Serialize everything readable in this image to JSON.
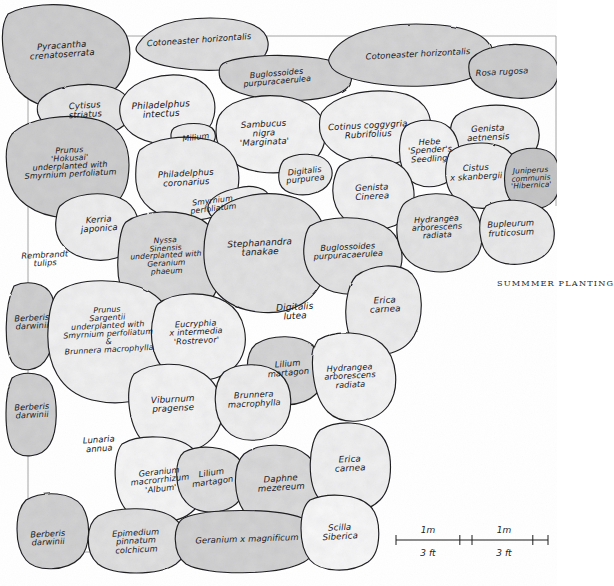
{
  "figure": {
    "caption": "SUMMMER PLANTING",
    "caption_x": 497,
    "caption_y": 278
  },
  "scale_bar": {
    "x": 396,
    "y": 540,
    "width": 152,
    "labels_above": [
      "1m",
      "1m"
    ],
    "labels_below": [
      "3 ft",
      "3 ft"
    ]
  },
  "beds": [
    {
      "name": "pyracantha-crenatoserrata",
      "text": "Pyracantha\ncrenatoserrata",
      "cx": 62,
      "cy": 50,
      "fs": 8.6,
      "rot": -4,
      "tone": 0.46,
      "path": "M 8,14 C 26,4 58,2 82,8 C 106,14 124,24 128,40 C 133,58 128,78 112,92 C 96,106 66,112 44,106 C 24,100 10,86 6,66 C 2,48 0,26 8,14 Z"
    },
    {
      "name": "cotoneaster-horizontalis-left",
      "text": "Cotoneaster horizontalis",
      "cx": 199,
      "cy": 40,
      "fs": 8.4,
      "rot": -4,
      "tone": 0.3,
      "path": "M 138,44 C 150,26 176,18 210,18 C 244,18 266,26 268,42 C 270,58 254,68 222,70 C 190,72 156,66 144,58 C 136,52 134,50 138,44 Z"
    },
    {
      "name": "buglossoides-purpurocaerulea-top",
      "text": "Buglossoides\npurpuracaerulea",
      "cx": 277,
      "cy": 78,
      "fs": 8.0,
      "rot": -5,
      "tone": 0.42,
      "path": "M 226,62 C 250,54 286,54 318,58 C 344,62 356,72 350,84 C 344,96 314,102 280,100 C 248,98 224,90 220,78 C 218,70 220,64 226,62 Z"
    },
    {
      "name": "cotoneaster-horizontalis-right",
      "text": "Cotoneaster horizontalis",
      "cx": 418,
      "cy": 54,
      "fs": 8.4,
      "rot": -3,
      "tone": 0.4,
      "path": "M 330,56 C 340,36 372,24 416,24 C 462,24 490,34 492,52 C 494,72 470,84 424,86 C 378,88 340,78 332,68 C 328,62 328,60 330,56 Z"
    },
    {
      "name": "rosa-rugosa",
      "text": "Rosa rugosa",
      "cx": 502,
      "cy": 72,
      "fs": 8.4,
      "rot": -3,
      "tone": 0.46,
      "path": "M 472,58 C 484,46 510,42 532,46 C 552,50 560,62 558,76 C 556,92 538,100 514,98 C 492,96 474,88 470,76 C 468,68 468,62 472,58 Z"
    },
    {
      "name": "cytisus-striatus",
      "text": "Cytisus\nstriatus",
      "cx": 85,
      "cy": 110,
      "fs": 8.6,
      "rot": -4,
      "tone": 0.22,
      "path": "M 42,98 C 54,86 84,82 106,86 C 126,90 134,102 130,116 C 126,130 104,138 80,136 C 58,134 42,126 38,114 C 36,106 38,102 42,98 Z"
    },
    {
      "name": "philadelphus-intectus",
      "text": "Philadelphus\nintectus",
      "cx": 161,
      "cy": 110,
      "fs": 9.0,
      "rot": -3,
      "tone": 0.1,
      "path": "M 124,96 C 134,80 162,72 186,76 C 208,80 218,96 214,116 C 210,136 188,146 162,144 C 138,142 122,130 120,114 C 119,106 121,100 124,96 Z"
    },
    {
      "name": "sambucus-nigra-marginata",
      "text": "Sambucus\nnigra\n'Marginata'",
      "cx": 264,
      "cy": 133,
      "fs": 8.6,
      "rot": -3,
      "tone": 0.1,
      "path": "M 222,112 C 234,98 264,92 292,98 C 318,104 330,122 324,144 C 318,166 290,176 260,172 C 232,168 216,152 216,132 C 216,122 218,116 222,112 Z"
    },
    {
      "name": "cotinus-coggygria-rubrifolius",
      "text": "Cotinus coggygria\nRubrifolius",
      "cx": 368,
      "cy": 130,
      "fs": 8.6,
      "rot": -3,
      "tone": 0.1,
      "path": "M 322,112 C 334,96 364,88 396,92 C 422,96 434,112 430,134 C 426,156 402,166 372,164 C 344,162 324,150 320,132 C 319,124 320,116 322,112 Z"
    },
    {
      "name": "genista-aetnensis",
      "text": "Genista\naetnensis",
      "cx": 488,
      "cy": 133,
      "fs": 8.6,
      "rot": -3,
      "tone": 0.14,
      "path": "M 456,116 C 468,106 496,102 518,108 C 536,114 542,128 538,144 C 534,160 512,168 488,166 C 464,164 450,152 450,136 C 450,126 452,120 456,116 Z"
    },
    {
      "name": "hebe-spenders-seedling",
      "text": "Hebe\n'Spender's\nSeedling'",
      "cx": 430,
      "cy": 150,
      "fs": 8.2,
      "rot": -3,
      "tone": 0.1,
      "path": "M 406,126 C 418,118 440,118 450,128 C 460,138 462,158 456,172 C 450,186 430,190 416,184 C 402,178 398,160 400,142 C 401,134 403,129 406,126 Z"
    },
    {
      "name": "cistus-x-skanbergii",
      "text": "Cistus\nx skanbergii",
      "cx": 476,
      "cy": 172,
      "fs": 8.4,
      "rot": -3,
      "tone": 0.14,
      "path": "M 450,152 C 462,142 488,140 504,148 C 518,156 522,174 516,190 C 510,206 486,212 468,206 C 450,200 444,184 446,166 C 447,159 448,155 450,152 Z"
    },
    {
      "name": "juniperus-communis-hibernica",
      "text": "Juniperus\ncommunis\n'Hibernica'",
      "cx": 531,
      "cy": 178,
      "fs": 7.4,
      "rot": -3,
      "tone": 0.54,
      "path": "M 512,154 C 524,146 546,146 554,156 C 562,168 562,190 554,200 C 544,212 522,212 512,202 C 502,192 502,166 512,154 Z"
    },
    {
      "name": "prunus-hokusai",
      "text": "Prunus\n'Hokusai'\nunderplanted with\nSmyrnium perfoliatum",
      "cx": 70,
      "cy": 163,
      "fs": 8.0,
      "rot": -3,
      "tone": 0.46,
      "path": "M 12,134 C 28,118 68,112 98,120 C 124,128 132,150 128,178 C 124,206 100,220 66,218 C 34,216 12,200 8,176 C 5,158 6,142 12,134 Z"
    },
    {
      "name": "milium",
      "text": "Milium",
      "cx": 196,
      "cy": 138,
      "fs": 8.0,
      "rot": -7,
      "tone": 0.14,
      "path": "M 174,128 C 184,122 204,122 212,128 C 218,134 216,144 206,148 C 194,152 176,150 172,142 C 170,136 171,130 174,128 Z"
    },
    {
      "name": "philadelphus-coronarius",
      "text": "Philadelphus\ncoronarius",
      "cx": 186,
      "cy": 178,
      "fs": 8.6,
      "rot": -3,
      "tone": 0.14,
      "path": "M 140,150 C 154,138 184,134 210,140 C 232,146 242,164 238,188 C 234,212 212,222 184,220 C 156,218 138,204 136,182 C 135,168 137,154 140,150 Z"
    },
    {
      "name": "smyrnium-perfoliatum-mid",
      "text": "Smyrnium\nperfoliatum",
      "cx": 213,
      "cy": 205,
      "fs": 7.8,
      "rot": -7,
      "tone": 0.12,
      "path": "M 238,188 C 252,184 268,188 270,198 C 272,210 258,220 238,222 C 220,224 208,218 208,208 C 208,198 222,191 238,188 Z"
    },
    {
      "name": "digitalis-purpurea",
      "text": "Digitalis\npurpurea",
      "cx": 305,
      "cy": 175,
      "fs": 8.2,
      "rot": -6,
      "tone": 0.16,
      "path": "M 284,160 C 296,152 320,152 328,162 C 336,172 332,186 318,192 C 302,198 284,194 280,184 C 277,176 280,164 284,160 Z"
    },
    {
      "name": "genista-cinerea",
      "text": "Genista\nCinerea",
      "cx": 372,
      "cy": 192,
      "fs": 8.6,
      "rot": -3,
      "tone": 0.12,
      "path": "M 340,166 C 352,156 380,154 398,164 C 414,174 418,196 410,212 C 402,228 376,234 356,226 C 336,218 330,198 334,180 C 336,172 338,168 340,166 Z"
    },
    {
      "name": "kerria-japonica",
      "text": "Kerria\njaponica",
      "cx": 99,
      "cy": 224,
      "fs": 8.6,
      "rot": -4,
      "tone": 0.14,
      "path": "M 60,206 C 72,194 100,190 120,198 C 138,206 142,224 136,240 C 130,258 106,264 84,258 C 62,252 54,236 56,220 C 57,212 58,208 60,206 Z"
    },
    {
      "name": "nyssa-sinensis",
      "text": "Nyssa\nSinensis\nunderplanted with\nGeranium\nphaeum",
      "cx": 166,
      "cy": 256,
      "fs": 7.6,
      "rot": -3,
      "tone": 0.34,
      "path": "M 126,222 C 142,210 180,208 202,220 C 222,232 226,260 218,286 C 210,312 182,322 154,316 C 126,310 116,288 118,258 C 119,240 122,226 126,222 Z"
    },
    {
      "name": "stephanandra-tanakae",
      "text": "Stephanandra\ntanakae",
      "cx": 260,
      "cy": 248,
      "fs": 9.0,
      "rot": -3,
      "tone": 0.26,
      "path": "M 212,216 C 228,196 266,188 296,198 C 322,208 332,236 326,268 C 320,300 292,316 258,312 C 224,308 206,288 204,258 C 203,236 208,222 212,216 Z"
    },
    {
      "name": "buglossoides-purpurocaerulea-mid",
      "text": "Buglossoides\npurpuracaerulea",
      "cx": 348,
      "cy": 251,
      "fs": 8.2,
      "rot": -3,
      "tone": 0.26,
      "path": "M 310,226 C 326,216 362,214 384,226 C 402,236 406,258 398,274 C 388,292 358,298 334,292 C 312,286 302,266 304,246 C 305,236 307,229 310,226 Z"
    },
    {
      "name": "hydrangea-arborescens-radiata-top",
      "text": "Hydrangea\narborescens\nradiata",
      "cx": 437,
      "cy": 228,
      "fs": 8.0,
      "rot": -3,
      "tone": 0.24,
      "path": "M 406,202 C 420,192 450,190 466,202 C 482,214 486,238 478,254 C 468,272 440,276 420,268 C 400,260 394,238 398,218 C 400,209 403,204 406,202 Z"
    },
    {
      "name": "bupleurum-fruticosum",
      "text": "Bupleurum\nfruticosum",
      "cx": 511,
      "cy": 228,
      "fs": 8.4,
      "rot": -3,
      "tone": 0.18,
      "path": "M 486,206 C 500,198 528,198 542,208 C 556,218 558,240 548,252 C 536,266 506,268 492,258 C 478,248 476,220 486,206 Z"
    },
    {
      "name": "rembrandt-tulips",
      "text": "Rembrandt\ntulips",
      "cx": 45,
      "cy": 259,
      "fs": 8.2,
      "rot": -3,
      "tone": 0.05,
      "path": ""
    },
    {
      "name": "berberis-darwinii-1",
      "text": "Berberis\ndarwinii",
      "cx": 32,
      "cy": 322,
      "fs": 8.2,
      "rot": -3,
      "tone": 0.44,
      "path": "M 14,286 C 26,280 46,282 52,296 C 58,312 56,342 48,356 C 40,372 20,374 12,362 C 4,348 4,306 14,286 Z"
    },
    {
      "name": "prunus-sargentii",
      "text": "Prunus\nSargentii\nunderplanted with\nSmyrnium perfoliatum\n&\nBrunnera macrophylla",
      "cx": 108,
      "cy": 330,
      "fs": 7.8,
      "rot": -3,
      "tone": 0.12,
      "path": "M 58,292 C 76,278 122,276 150,292 C 176,308 184,342 174,370 C 164,398 126,408 92,400 C 60,392 46,364 48,330 C 49,310 53,297 58,292 Z"
    },
    {
      "name": "eucryphia-x-intermedia-rostrevor",
      "text": "Eucryphia\nx intermedia\n'Rostrevor'",
      "cx": 196,
      "cy": 332,
      "fs": 8.2,
      "rot": -3,
      "tone": 0.1,
      "path": "M 158,304 C 172,292 206,290 226,302 C 246,314 250,342 240,360 C 228,380 196,386 174,376 C 152,366 148,336 154,314 C 155,309 156,306 158,304 Z"
    },
    {
      "name": "digitalis-lutea",
      "text": "Digitalis\nlutea",
      "cx": 295,
      "cy": 312,
      "fs": 9.0,
      "rot": -3,
      "tone": 0.08,
      "path": ""
    },
    {
      "name": "erica-carnea-top",
      "text": "Erica\ncarnea",
      "cx": 385,
      "cy": 305,
      "fs": 8.8,
      "rot": -3,
      "tone": 0.16,
      "path": "M 356,276 C 372,264 400,262 412,274 C 424,288 424,318 414,336 C 402,356 372,360 358,348 C 342,334 342,292 356,276 Z"
    },
    {
      "name": "lilium-martagon-top",
      "text": "Lilium\nmartagon",
      "cx": 288,
      "cy": 368,
      "fs": 8.4,
      "rot": -5,
      "tone": 0.38,
      "path": "M 256,344 C 272,334 300,334 314,346 C 328,358 328,382 316,394 C 302,408 272,408 258,396 C 244,384 244,354 256,344 Z"
    },
    {
      "name": "hydrangea-arborescens-radiata-mid",
      "text": "Hydrangea\narborescens\nradiata",
      "cx": 350,
      "cy": 376,
      "fs": 8.2,
      "rot": -3,
      "tone": 0.1,
      "path": "M 318,340 C 334,330 366,330 382,344 C 398,358 400,390 388,406 C 374,424 342,426 328,412 C 312,396 308,354 318,340 Z"
    },
    {
      "name": "viburnum-pragense",
      "text": "Viburnum\npragense",
      "cx": 173,
      "cy": 404,
      "fs": 8.8,
      "rot": -3,
      "tone": 0.1,
      "path": "M 134,374 C 150,362 184,360 204,374 C 224,388 228,418 214,436 C 198,456 164,458 146,444 C 128,430 124,388 134,374 Z"
    },
    {
      "name": "brunnera-macrophylla",
      "text": "Brunnera\nmacrophylla",
      "cx": 254,
      "cy": 399,
      "fs": 8.4,
      "rot": -3,
      "tone": 0.14,
      "path": "M 224,372 C 238,362 266,362 280,374 C 294,386 294,414 282,428 C 268,444 238,444 226,430 C 212,416 212,384 224,372 Z"
    },
    {
      "name": "lunaria-annua",
      "text": "Lunaria\nannua",
      "cx": 99,
      "cy": 444,
      "fs": 8.4,
      "rot": -4,
      "tone": 0.08,
      "path": ""
    },
    {
      "name": "berberis-darwinii-2",
      "text": "Berberis\ndarwinii",
      "cx": 32,
      "cy": 411,
      "fs": 8.2,
      "rot": -3,
      "tone": 0.44,
      "path": "M 12,378 C 24,370 46,372 52,386 C 58,402 58,430 50,444 C 42,458 20,460 12,448 C 4,434 4,394 12,378 Z"
    },
    {
      "name": "geranium-macrorrhizum-album",
      "text": "Geranium\nmacrorrhizum\n'Album'",
      "cx": 160,
      "cy": 480,
      "fs": 8.2,
      "rot": -6,
      "tone": 0.08,
      "path": "M 122,444 C 138,434 176,434 192,448 C 208,462 208,496 194,510 C 178,526 142,526 128,512 C 112,496 112,456 122,444 Z"
    },
    {
      "name": "lilium-martagon-bottom",
      "text": "Lilium\nmartagon",
      "cx": 212,
      "cy": 477,
      "fs": 8.4,
      "rot": -8,
      "tone": 0.3,
      "path": "M 184,452 C 200,444 226,446 238,458 C 250,470 248,494 236,504 C 222,516 196,514 186,502 C 174,490 174,460 184,452 Z"
    },
    {
      "name": "daphne-mezereum",
      "text": "Daphne\nmezereum",
      "cx": 281,
      "cy": 483,
      "fs": 8.6,
      "rot": -4,
      "tone": 0.34,
      "path": "M 244,454 C 260,442 292,442 308,456 C 324,470 326,500 312,514 C 296,530 262,530 248,516 C 232,500 232,466 244,454 Z"
    },
    {
      "name": "erica-carnea-bottom",
      "text": "Erica\ncarnea",
      "cx": 350,
      "cy": 464,
      "fs": 8.8,
      "rot": -3,
      "tone": 0.12,
      "path": "M 320,430 C 336,420 366,420 380,434 C 394,448 394,486 380,500 C 364,516 332,516 320,500 C 306,484 308,442 320,430 Z"
    },
    {
      "name": "berberis-darwinii-3",
      "text": "Berberis\ndarwinii",
      "cx": 48,
      "cy": 538,
      "fs": 8.2,
      "rot": -3,
      "tone": 0.42,
      "path": "M 26,500 C 44,490 72,492 82,506 C 92,522 90,548 80,558 C 66,572 36,572 26,560 C 14,546 14,512 26,500 Z"
    },
    {
      "name": "epimedium-pinnatum-colchicum",
      "text": "Epimedium\npinnatum\ncolchicum",
      "cx": 136,
      "cy": 541,
      "fs": 8.2,
      "rot": -3,
      "tone": 0.28,
      "path": "M 98,516 C 116,506 158,506 174,518 C 190,530 190,554 176,564 C 158,576 114,576 98,564 C 84,552 86,524 98,516 Z"
    },
    {
      "name": "geranium-x-magnificum",
      "text": "Geranium x magnificum",
      "cx": 247,
      "cy": 539,
      "fs": 8.4,
      "rot": -2,
      "tone": 0.42,
      "path": "M 184,518 C 206,508 276,508 302,518 C 322,526 322,552 304,562 C 278,576 206,576 186,564 C 172,554 172,524 184,518 Z"
    },
    {
      "name": "scilla-siberica",
      "text": "Scilla\nSiberica",
      "cx": 340,
      "cy": 532,
      "fs": 8.6,
      "rot": -3,
      "tone": 0.06,
      "path": "M 310,500 C 328,492 358,494 370,506 C 382,518 382,552 368,562 C 350,574 320,572 310,560 C 298,546 298,510 310,500 Z"
    }
  ]
}
